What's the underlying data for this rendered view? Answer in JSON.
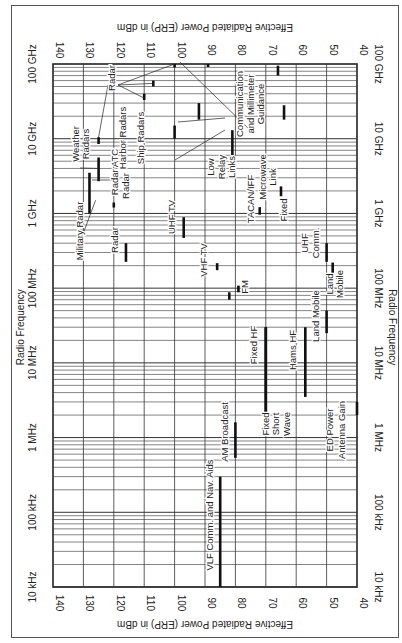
{
  "chart_data": {
    "type": "bar",
    "orientation": "rotated-90",
    "title": "",
    "xlabel": "Effective Radiated Power (ERP) in dBm",
    "ylabel": "Radio Frequency",
    "x_axis": {
      "label": "Effective Radiated Power (ERP) in dBm",
      "range": [
        140,
        40
      ],
      "ticks": [
        140,
        130,
        120,
        110,
        100,
        90,
        80,
        70,
        60,
        50,
        40
      ]
    },
    "y_axis": {
      "label": "Radio Frequency",
      "scale": "log",
      "range_hz": [
        10000,
        100000000000
      ],
      "ticks": [
        "10 kHz",
        "100 kHz",
        "1 MHz",
        "10 MHz",
        "100 MHz",
        "1 GHz",
        "10 GHz",
        "100 GHz"
      ]
    },
    "grid": true,
    "series": [
      {
        "name": "VLF Comm. and Nav. Aids",
        "erp_dbm": 85,
        "f_low_hz": 10000,
        "f_high_hz": 300000
      },
      {
        "name": "AM Broadcast",
        "erp_dbm": 80,
        "f_low_hz": 535000,
        "f_high_hz": 1600000
      },
      {
        "name": "Fixed HF",
        "erp_dbm": 70,
        "f_low_hz": 2000000,
        "f_high_hz": 30000000
      },
      {
        "name": "Fixed Short Wave",
        "erp_dbm": 70,
        "f_low_hz": 2000000,
        "f_high_hz": 30000000
      },
      {
        "name": "Hams HF",
        "erp_dbm": 57,
        "f_low_hz": 3500000,
        "f_high_hz": 30000000
      },
      {
        "name": "Land Mobile",
        "erp_dbm": 50,
        "f_low_hz": 25000000,
        "f_high_hz": 50000000
      },
      {
        "name": "Land Mobile (UHF)",
        "erp_dbm": 48,
        "f_low_hz": 150000000,
        "f_high_hz": 220000000
      },
      {
        "name": "UHF Comm.",
        "erp_dbm": 50,
        "f_low_hz": 225000000,
        "f_high_hz": 400000000
      },
      {
        "name": "FM",
        "erp_dbm": 79,
        "f_low_hz": 88000000,
        "f_high_hz": 108000000
      },
      {
        "name": "Land Mobile (VHF)",
        "erp_dbm": 82,
        "f_low_hz": 70000000,
        "f_high_hz": 88000000
      },
      {
        "name": "VHF TV",
        "erp_dbm": 86,
        "f_low_hz": 174000000,
        "f_high_hz": 216000000
      },
      {
        "name": "UHF TV",
        "erp_dbm": 97,
        "f_low_hz": 470000000,
        "f_high_hz": 890000000
      },
      {
        "name": "Radar (UHF)",
        "erp_dbm": 116,
        "f_low_hz": 225000000,
        "f_high_hz": 400000000
      },
      {
        "name": "Radar ATC",
        "erp_dbm": 120,
        "f_low_hz": 1200000000,
        "f_high_hz": 1400000000
      },
      {
        "name": "Radar ATC (S-band)",
        "erp_dbm": 120,
        "f_low_hz": 2700000000,
        "f_high_hz": 2900000000
      },
      {
        "name": "TACAN/IFF",
        "erp_dbm": 72,
        "f_low_hz": 960000000,
        "f_high_hz": 1215000000
      },
      {
        "name": "Microwave Link",
        "erp_dbm": 71,
        "f_low_hz": 2000000000,
        "f_high_hz": 4000000000
      },
      {
        "name": "Fixed",
        "erp_dbm": 65,
        "f_low_hz": 1700000000,
        "f_high_hz": 2300000000
      },
      {
        "name": "Low Relay Links",
        "erp_dbm": 81,
        "f_low_hz": 6000000000,
        "f_high_hz": 13000000000
      },
      {
        "name": "Military Radar",
        "erp_dbm": 128,
        "f_low_hz": 1000000000,
        "f_high_hz": 3500000000
      },
      {
        "name": "Weather Radars",
        "erp_dbm": 125,
        "f_low_hz": 2700000000,
        "f_high_hz": 5600000000
      },
      {
        "name": "Harbor Radars",
        "erp_dbm": 117,
        "f_low_hz": 9300000000,
        "f_high_hz": 9500000000
      },
      {
        "name": "Ship Radars",
        "erp_dbm": 111,
        "f_low_hz": 9000000000,
        "f_high_hz": 9700000000
      },
      {
        "name": "Radar (X-band)",
        "erp_dbm": 125,
        "f_low_hz": 8500000000,
        "f_high_hz": 10500000000
      },
      {
        "name": "Radar (Ku-band)",
        "erp_dbm": 110,
        "f_low_hz": 33000000000,
        "f_high_hz": 40000000000
      },
      {
        "name": "Radar (Ka-band)",
        "erp_dbm": 107,
        "f_low_hz": 50000000000,
        "f_high_hz": 60000000000
      },
      {
        "name": "Radar (W-band)",
        "erp_dbm": 100,
        "f_low_hz": 90000000000,
        "f_high_hz": 100000000000
      },
      {
        "name": "Communication and Millimeter Guidance",
        "erp_dbm": 100,
        "f_low_hz": 10000000000,
        "f_high_hz": 15000000000
      },
      {
        "name": "Communication (K-band)",
        "erp_dbm": 92,
        "f_low_hz": 18000000000,
        "f_high_hz": 30000000000
      },
      {
        "name": "Millimeter Guidance (94 GHz)",
        "erp_dbm": 89,
        "f_low_hz": 94000000000,
        "f_high_hz": 100000000000
      },
      {
        "name": "Guidance (60-70 GHz)",
        "erp_dbm": 66,
        "f_low_hz": 70000000000,
        "f_high_hz": 95000000000
      },
      {
        "name": "Guidance (30 GHz)",
        "erp_dbm": 64,
        "f_low_hz": 18000000000,
        "f_high_hz": 28000000000
      },
      {
        "name": "ED Power Antenna Gain",
        "erp_dbm": 40,
        "f_low_hz": 2000000,
        "f_high_hz": 3000000
      }
    ]
  },
  "axes": {
    "power_title": "Effective Radiated Power (ERP) in dBm",
    "freq_title": "Radio Frequency",
    "power_ticks": [
      "140",
      "130",
      "120",
      "110",
      "100",
      "90",
      "80",
      "70",
      "60",
      "50",
      "40"
    ],
    "freq_ticks": [
      "10 kHz",
      "100 kHz",
      "1 MHz",
      "10 MHz",
      "100 MHz",
      "1 GHz",
      "10 GHz",
      "100 GHz"
    ]
  },
  "annotations": [
    {
      "text": "VLF Comm. and Nav. Aids",
      "dbm": 87.5,
      "y": 515
    },
    {
      "text": "AM Broadcast",
      "dbm": 82.5,
      "y": 432
    },
    {
      "text": "Fixed HF",
      "dbm": 73,
      "y": 345
    },
    {
      "text": "Fixed",
      "dbm": 69,
      "y": 424
    },
    {
      "text": "Short",
      "dbm": 65.5,
      "y": 424
    },
    {
      "text": "Wave",
      "dbm": 62,
      "y": 424
    },
    {
      "text": "Hams HF",
      "dbm": 60,
      "y": 350
    },
    {
      "text": "Land Mobile",
      "dbm": 52.5,
      "y": 316
    },
    {
      "text": "ED Power",
      "dbm": 48,
      "y": 430
    },
    {
      "text": "Antenna Gain",
      "dbm": 44,
      "y": 430
    },
    {
      "text": "FM",
      "dbm": 76,
      "y": 287
    },
    {
      "text": "VHF TV",
      "dbm": 89.5,
      "y": 260
    },
    {
      "text": "UHF TV",
      "dbm": 100,
      "y": 217
    },
    {
      "text": "Radar",
      "dbm": 118.5,
      "y": 240
    },
    {
      "text": "Military Radar",
      "dbm": 130,
      "y": 231
    },
    {
      "text": "Radar",
      "dbm": 115,
      "y": 186
    },
    {
      "text": "Radar ATC",
      "dbm": 118.5,
      "y": 172
    },
    {
      "text": "Weather",
      "dbm": 131.5,
      "y": 144
    },
    {
      "text": "Radars",
      "dbm": 128,
      "y": 144
    },
    {
      "text": "Harbor Radars",
      "dbm": 116,
      "y": 138
    },
    {
      "text": "Ship Radars",
      "dbm": 110,
      "y": 138
    },
    {
      "text": "Radar",
      "dbm": 119.5,
      "y": 78
    },
    {
      "text": "Low",
      "dbm": 87,
      "y": 167
    },
    {
      "text": "Relay",
      "dbm": 83.5,
      "y": 167
    },
    {
      "text": "Links",
      "dbm": 80,
      "y": 167
    },
    {
      "text": "TACAN/IFF",
      "dbm": 74,
      "y": 199
    },
    {
      "text": "Microwave",
      "dbm": 70,
      "y": 177
    },
    {
      "text": "Link",
      "dbm": 66.5,
      "y": 177
    },
    {
      "text": "Fixed",
      "dbm": 63,
      "y": 210
    },
    {
      "text": "Communication",
      "dbm": 77.5,
      "y": 104
    },
    {
      "text": "and Millimeter",
      "dbm": 74,
      "y": 104
    },
    {
      "text": "Guidance",
      "dbm": 70.5,
      "y": 104
    },
    {
      "text": "UHF",
      "dbm": 56,
      "y": 243
    },
    {
      "text": "Comm.",
      "dbm": 52.5,
      "y": 243
    },
    {
      "text": "Land",
      "dbm": 48,
      "y": 284
    },
    {
      "text": "Mobile",
      "dbm": 44.5,
      "y": 284
    }
  ],
  "colors": {
    "ink": "#222222",
    "grid": "#333333",
    "background": "#ffffff"
  }
}
